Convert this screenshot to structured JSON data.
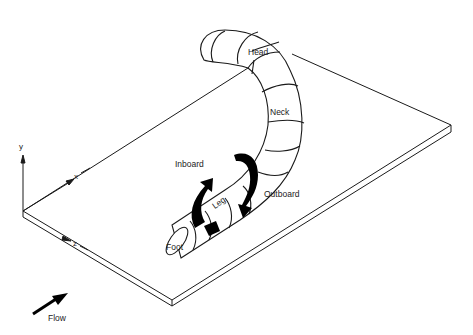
{
  "diagram": {
    "labels": {
      "head": "Head",
      "neck": "Neck",
      "leg": "Leg",
      "foot": "Foot",
      "inboard": "Inboard",
      "outboard": "Outboard",
      "flow": "Flow"
    },
    "axes": {
      "x": "x",
      "y": "y",
      "z": "z"
    },
    "colors": {
      "line": "#1a1a1a",
      "fill": "#000000",
      "background": "#ffffff"
    }
  }
}
